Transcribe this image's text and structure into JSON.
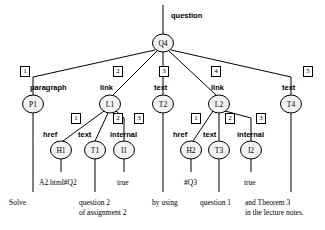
{
  "diagram": {
    "title_label": "question",
    "nodes": [
      {
        "id": "Q4",
        "label": "Q4",
        "cx": 163,
        "cy": 43,
        "rx": 10.5,
        "ry": 9
      },
      {
        "id": "P1",
        "label": "P1",
        "cx": 33,
        "cy": 104,
        "rx": 10.5,
        "ry": 9
      },
      {
        "id": "L1",
        "label": "L1",
        "cx": 110,
        "cy": 104,
        "rx": 10.5,
        "ry": 9
      },
      {
        "id": "T2",
        "label": "T2",
        "cx": 163,
        "cy": 104,
        "rx": 10.5,
        "ry": 9
      },
      {
        "id": "L2",
        "label": "L2",
        "cx": 219,
        "cy": 104,
        "rx": 10.5,
        "ry": 9
      },
      {
        "id": "T4",
        "label": "T4",
        "cx": 291,
        "cy": 104,
        "rx": 10.5,
        "ry": 9
      },
      {
        "id": "H1",
        "label": "H1",
        "cx": 61,
        "cy": 150,
        "rx": 10.5,
        "ry": 9
      },
      {
        "id": "T1",
        "label": "T1",
        "cx": 95,
        "cy": 150,
        "rx": 10.5,
        "ry": 9
      },
      {
        "id": "I1",
        "label": "I1",
        "cx": 124,
        "cy": 150,
        "rx": 10.5,
        "ry": 9
      },
      {
        "id": "H2",
        "label": "H2",
        "cx": 191,
        "cy": 150,
        "rx": 10.5,
        "ry": 9
      },
      {
        "id": "T3",
        "label": "T3",
        "cx": 219,
        "cy": 150,
        "rx": 10.5,
        "ry": 9
      },
      {
        "id": "I2",
        "label": "I2",
        "cx": 251,
        "cy": 150,
        "rx": 10.5,
        "ry": 9
      }
    ],
    "edge_tags": [
      {
        "index": "1",
        "x": 20,
        "y": 66
      },
      {
        "index": "2",
        "x": 113,
        "y": 66
      },
      {
        "index": "3",
        "x": 159,
        "y": 66
      },
      {
        "index": "4",
        "x": 211,
        "y": 66
      },
      {
        "index": "5",
        "x": 303,
        "y": 66
      },
      {
        "index": "1",
        "x": 71,
        "y": 113
      },
      {
        "index": "2",
        "x": 113,
        "y": 113
      },
      {
        "index": "3",
        "x": 134,
        "y": 113
      },
      {
        "index": "1",
        "x": 191,
        "y": 113
      },
      {
        "index": "2",
        "x": 225,
        "y": 113
      },
      {
        "index": "3",
        "x": 256,
        "y": 113
      }
    ],
    "type_labels": [
      {
        "text": "paragraph",
        "x": 30,
        "y": 84
      },
      {
        "text": "link",
        "x": 100,
        "y": 84
      },
      {
        "text": "text",
        "x": 154,
        "y": 84
      },
      {
        "text": "link",
        "x": 211,
        "y": 84
      },
      {
        "text": "text",
        "x": 282,
        "y": 84
      },
      {
        "text": "href",
        "x": 43,
        "y": 131
      },
      {
        "text": "text",
        "x": 78,
        "y": 131
      },
      {
        "text": "internal",
        "x": 110,
        "y": 131
      },
      {
        "text": "href",
        "x": 173,
        "y": 131
      },
      {
        "text": "text",
        "x": 203,
        "y": 131
      },
      {
        "text": "internal",
        "x": 237,
        "y": 131
      }
    ],
    "value_labels": [
      {
        "text": "A2.html#Q2",
        "x": 39,
        "y": 178
      },
      {
        "text": "true",
        "x": 117,
        "y": 178
      },
      {
        "text": "#Q3",
        "x": 184,
        "y": 178
      },
      {
        "text": "true",
        "x": 244,
        "y": 178
      }
    ],
    "content_labels": [
      {
        "lines": [
          "Solve"
        ],
        "x": 9,
        "y": 198
      },
      {
        "lines": [
          "question 2",
          "of assignment 2"
        ],
        "x": 79,
        "y": 198
      },
      {
        "lines": [
          "by using"
        ],
        "x": 152,
        "y": 198
      },
      {
        "lines": [
          "question 1"
        ],
        "x": 200,
        "y": 198
      },
      {
        "lines": [
          "and Theorem 3",
          "in the lecture notes."
        ],
        "x": 245,
        "y": 198
      }
    ],
    "edges": [
      {
        "from": "root-stem",
        "d": "M163,5 L163,34"
      },
      {
        "from": "Q4",
        "to": "P1",
        "d": "M155,50 L33,77"
      },
      {
        "from": "Q4",
        "to": "L1",
        "d": "M157,51 L113,95"
      },
      {
        "from": "Q4",
        "to": "T2",
        "d": "M163,52 L163,95"
      },
      {
        "from": "Q4",
        "to": "L2",
        "d": "M169,51 L216,95"
      },
      {
        "from": "Q4",
        "to": "T4",
        "d": "M171,50 L291,77"
      },
      {
        "from": "P1",
        "to": "P1-stem",
        "d": "M33,77 L33,95"
      },
      {
        "from": "T4",
        "to": "T4-stem",
        "d": "M291,77 L291,95"
      },
      {
        "from": "L1",
        "to": "H1",
        "d": "M104,111 L63,141"
      },
      {
        "from": "L1",
        "to": "T1",
        "d": "M108,113 L95,141"
      },
      {
        "from": "L1",
        "to": "I1",
        "d": "M116,111 L124,118 L124,141"
      },
      {
        "from": "L2",
        "to": "H2",
        "d": "M213,111 L193,141"
      },
      {
        "from": "L2",
        "to": "T3",
        "d": "M219,113 L219,141"
      },
      {
        "from": "L2",
        "to": "I2",
        "d": "M225,111 L251,118 L251,141"
      },
      {
        "from": "H1",
        "to": "H1-val",
        "d": "M61,159 L61,172"
      },
      {
        "from": "T1",
        "to": "T1-content",
        "d": "M95,159 L95,192"
      },
      {
        "from": "I1",
        "to": "I1-val",
        "d": "M124,159 L124,172"
      },
      {
        "from": "H2",
        "to": "H2-val",
        "d": "M191,159 L191,172"
      },
      {
        "from": "T3",
        "to": "T3-content",
        "d": "M219,159 L219,192"
      },
      {
        "from": "I2",
        "to": "I2-val",
        "d": "M251,159 L251,172"
      },
      {
        "from": "P1",
        "to": "P1-content",
        "d": "M33,113 L33,192"
      },
      {
        "from": "T2",
        "to": "T2-content",
        "d": "M163,113 L163,192"
      },
      {
        "from": "T4",
        "to": "T4-content",
        "d": "M291,113 L291,192"
      }
    ],
    "colors": {
      "stroke": "#000000",
      "node_fill": "#f2f2f2",
      "background": "#ffffff"
    }
  }
}
